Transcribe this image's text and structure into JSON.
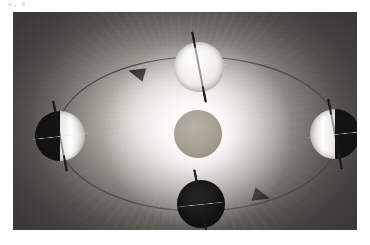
{
  "figure": {
    "kind": "astronomy-diagram",
    "caption": "",
    "frame": {
      "x": 13,
      "y": 12,
      "width": 344,
      "height": 218
    }
  },
  "colors": {
    "plate_corner": "#3a3937",
    "halo_center": "#f4f2ee",
    "sun_body": "#a8a296",
    "orbit_line": "#4a4846",
    "lit_hemisphere": "#f0eee8",
    "dark_hemisphere": "#141414",
    "axis_line": "#1d1d1d",
    "equator_line": "#f2f0ec",
    "arrow_fill": "#2a2a2a"
  },
  "sun": {
    "label": "Sun",
    "center_x": 185,
    "center_y": 122,
    "radius": 24,
    "glow_radius": 96
  },
  "orbit": {
    "label": "Earth's orbital path",
    "center_x": 185,
    "center_y": 122,
    "radius_x": 141,
    "radius_y": 77,
    "stroke_width": 1.2,
    "direction": "counterclockwise"
  },
  "arrows": [
    {
      "name": "orbit-arrow-upper-left",
      "x": 124,
      "y": 61,
      "rotation": -164,
      "size": 9
    },
    {
      "name": "orbit-arrow-lower-right",
      "x": 248,
      "y": 184,
      "rotation": 16,
      "size": 9
    }
  ],
  "earth_positions": [
    {
      "name": "earth-top",
      "season_label": "",
      "center_x": 186,
      "center_y": 55,
      "radius": 25,
      "lit_fraction": 1.0,
      "lit_side": "full",
      "axis_tilt_deg": -11,
      "axis_length": 72
    },
    {
      "name": "earth-left",
      "season_label": "",
      "center_x": 47,
      "center_y": 124,
      "radius": 25,
      "lit_fraction": 0.5,
      "lit_side": "right",
      "axis_tilt_deg": -11,
      "axis_length": 72
    },
    {
      "name": "earth-bottom",
      "season_label": "",
      "center_x": 188,
      "center_y": 192,
      "radius": 24,
      "lit_fraction": 0.0,
      "lit_side": "none",
      "axis_tilt_deg": -11,
      "axis_length": 70
    },
    {
      "name": "earth-right",
      "season_label": "",
      "center_x": 322,
      "center_y": 122,
      "radius": 25,
      "lit_fraction": 0.5,
      "lit_side": "left",
      "axis_tilt_deg": -11,
      "axis_length": 72
    }
  ],
  "scan_artifacts": [
    {
      "x": 8,
      "y": 3,
      "width": 4,
      "height": 3
    },
    {
      "x": 22,
      "y": 2,
      "width": 3,
      "height": 4
    },
    {
      "x": 14,
      "y": 5,
      "width": 2,
      "height": 2
    }
  ]
}
